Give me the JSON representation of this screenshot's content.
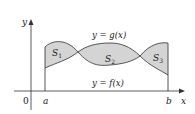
{
  "diagram": {
    "title": "",
    "axes": {
      "x_label": "x",
      "y_label": "y",
      "origin_label": "0"
    },
    "bounds": {
      "a_label": "a",
      "b_label": "b"
    },
    "curves": [
      {
        "id": "g",
        "label": "y = g(x)"
      },
      {
        "id": "f",
        "label": "y = f(x)"
      }
    ],
    "regions": [
      {
        "id": "S1",
        "label": "S",
        "sub": "1"
      },
      {
        "id": "S2",
        "label": "S",
        "sub": "2"
      },
      {
        "id": "S3",
        "label": "S",
        "sub": "3"
      }
    ],
    "colors": {
      "fill": "#d4d4d4",
      "stroke": "#444444",
      "axis": "#333333"
    }
  }
}
